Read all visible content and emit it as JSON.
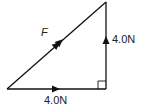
{
  "diagram": {
    "type": "vector-triangle",
    "labels": {
      "resultant": "F",
      "horizontal": "4.0N",
      "vertical": "4.0N"
    },
    "colors": {
      "line": "#111111",
      "background": "#ffffff"
    },
    "vertices": {
      "bottom_left": [
        7,
        89
      ],
      "bottom_right": [
        106,
        89
      ],
      "top_right": [
        106,
        2
      ]
    },
    "right_angle_marker": true
  }
}
